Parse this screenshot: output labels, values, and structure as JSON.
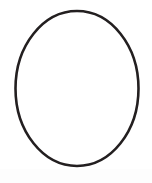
{
  "image": {
    "width": 152,
    "height": 183,
    "background_color": "#ffffff",
    "description_label": "ellipse-outline-figure"
  },
  "figure": {
    "name": "ellipse-outline",
    "shape_type": "ellipse",
    "fill_color": "#ffffff",
    "stroke_color": "#231f20",
    "stroke_width": 2.6,
    "center_x": 77,
    "center_y": 88.5,
    "radius_x": 61.5,
    "radius_y": 77.5,
    "bounds": {
      "left": 15,
      "right": 139,
      "top": 11,
      "bottom": 166
    }
  },
  "bottom_band": {
    "name": "bottom-light-band",
    "color": "#fdfdfd",
    "height": 14
  },
  "labels": {
    "none_visible": ""
  }
}
